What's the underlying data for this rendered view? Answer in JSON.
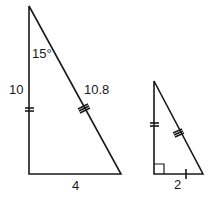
{
  "diagram": {
    "large_triangle": {
      "angle_label": "15°",
      "left_side_label": "10",
      "hypotenuse_label": "10.8",
      "base_label": "4",
      "left_side_ticks": 2,
      "hypotenuse_ticks": 3
    },
    "small_triangle": {
      "base_label": "2",
      "left_side_ticks": 2,
      "hypotenuse_ticks": 3,
      "base_ticks": 1,
      "right_angle_marker": true
    },
    "line_color": "#1a1a1a"
  }
}
